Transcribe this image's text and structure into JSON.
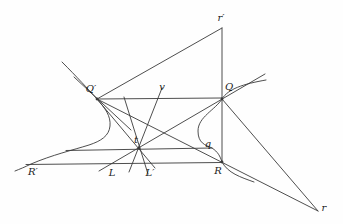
{
  "figure": {
    "width": 343,
    "height": 224,
    "background_color": "#fefefe",
    "stroke_color": "#3a3a3a",
    "label_color": "#222222",
    "stroke_width": 0.9,
    "label_font_size": 10,
    "labels": [
      {
        "id": "label-r-prime",
        "text": "r′",
        "x": 221,
        "y": 21
      },
      {
        "id": "label-Q-prime",
        "text": "Q′",
        "x": 91,
        "y": 92
      },
      {
        "id": "label-Q",
        "text": "Q",
        "x": 229,
        "y": 90
      },
      {
        "id": "label-v",
        "text": "v",
        "x": 162,
        "y": 90
      },
      {
        "id": "label-t",
        "text": "t",
        "x": 136,
        "y": 143
      },
      {
        "id": "label-q",
        "text": "q",
        "x": 208,
        "y": 147
      },
      {
        "id": "label-R-prime",
        "text": "R′",
        "x": 33,
        "y": 175
      },
      {
        "id": "label-L",
        "text": "L",
        "x": 112,
        "y": 176
      },
      {
        "id": "label-L-prime",
        "text": "L′",
        "x": 150,
        "y": 176
      },
      {
        "id": "label-R",
        "text": "R",
        "x": 218,
        "y": 174
      },
      {
        "id": "label-r",
        "text": "r",
        "x": 324,
        "y": 211
      }
    ],
    "lines": [
      {
        "id": "chord-Qprime-Q",
        "points": [
          [
            97,
            99
          ],
          [
            222,
            98
          ]
        ]
      },
      {
        "id": "chord-Rprime-R",
        "points": [
          [
            26,
            164.5
          ],
          [
            222,
            162.5
          ]
        ]
      },
      {
        "id": "chord-t-q",
        "points": [
          [
            66,
            150.5
          ],
          [
            212,
            148
          ]
        ]
      },
      {
        "id": "line-Qprime-rprime",
        "points": [
          [
            97,
            99
          ],
          [
            222,
            28
          ]
        ]
      },
      {
        "id": "line-rprime-R-vertical",
        "points": [
          [
            222,
            28
          ],
          [
            222,
            162.5
          ]
        ]
      },
      {
        "id": "line-L-t-Q-extended",
        "points": [
          [
            99,
            171
          ],
          [
            265,
            74
          ]
        ]
      },
      {
        "id": "line-Qprime-t-Lprime",
        "points": [
          [
            97,
            99
          ],
          [
            155,
            168
          ]
        ]
      },
      {
        "id": "line-v-through-t",
        "points": [
          [
            129,
            172
          ],
          [
            162,
            88
          ]
        ]
      },
      {
        "id": "line-through-t-steep",
        "points": [
          [
            124,
            97
          ],
          [
            148,
            174
          ]
        ]
      },
      {
        "id": "line-Qprime-R-r",
        "points": [
          [
            97,
            99
          ],
          [
            318,
            211
          ]
        ]
      },
      {
        "id": "line-Q-r",
        "points": [
          [
            222,
            99
          ],
          [
            318,
            211
          ]
        ]
      },
      {
        "id": "tangent-at-Qprime",
        "points": [
          [
            74,
            77
          ],
          [
            131,
            130
          ]
        ]
      }
    ],
    "curves": [
      {
        "id": "hyperbola-left-branch",
        "path": "M62,62 C77,77 88,89 97,99 C105,108 111,116 110,126 C109,136 101,141 89,145 C73,150 52,155 31,164 C25,167 20,169 15,171"
      },
      {
        "id": "hyperbola-right-branch",
        "path": "M266,80 C243,84 228,89 222,99 C215,110 198,117 198,131 C198,143 205,145 212,148 C218,152 220,156 222,162 C228,173 240,177 254,182"
      }
    ],
    "dots": [
      {
        "id": "point-Q-prime",
        "x": 97,
        "y": 99
      },
      {
        "id": "point-Q",
        "x": 222,
        "y": 99
      },
      {
        "id": "point-t",
        "x": 139,
        "y": 148
      },
      {
        "id": "point-R",
        "x": 222,
        "y": 162
      }
    ]
  }
}
